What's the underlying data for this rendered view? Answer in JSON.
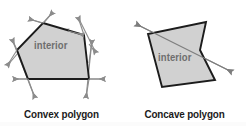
{
  "canvas": {
    "width": 246,
    "height": 126,
    "background": "#ffffff"
  },
  "style": {
    "polygon_fill": "#d1d1d1",
    "polygon_stroke": "#1c1c1c",
    "arrow_color": "#8c8c8c",
    "caption_color": "#1b1b1b",
    "interior_text_color": "#6e6e6e"
  },
  "figures": [
    {
      "id": "convex",
      "caption": "Convex polygon",
      "interior_label": "interior",
      "polygon_points": "43,23 84,35 89,79 28,79 17,50",
      "description": "Convex pentagon with a double-headed arrow extending along each edge line; no edge line crosses the interior."
    },
    {
      "id": "concave",
      "caption": "Concave polygon",
      "interior_label": "interior",
      "polygon_points": "206,22 200,50 215,80 162,87 148,34",
      "description": "Concave pentagon with a reflex vertex; one double-headed arrow along an edge line passes through the interior."
    }
  ],
  "arrows": {
    "convex": [
      {
        "name": "edge-arrow-top-left",
        "x1": 29,
        "y1": 19,
        "x2": 68,
        "y2": 31
      },
      {
        "name": "edge-arrow-top-right",
        "x1": 78,
        "y1": 17,
        "x2": 96,
        "y2": 53
      },
      {
        "name": "edge-arrow-right",
        "x1": 92,
        "y1": 40,
        "x2": 86,
        "y2": 97
      },
      {
        "name": "edge-arrow-bottom",
        "x1": 14,
        "y1": 79,
        "x2": 104,
        "y2": 79
      },
      {
        "name": "edge-arrow-left-lower",
        "x1": 35,
        "y1": 97,
        "x2": 12,
        "y2": 40
      },
      {
        "name": "edge-arrow-left-upper",
        "x1": 8,
        "y1": 65,
        "x2": 52,
        "y2": 12
      }
    ],
    "concave": [
      {
        "name": "interior-crossing-arrow",
        "x1": 136,
        "y1": 24,
        "x2": 232,
        "y2": 72
      }
    ]
  },
  "captions": {
    "convex": "Convex polygon",
    "concave": "Concave polygon"
  }
}
